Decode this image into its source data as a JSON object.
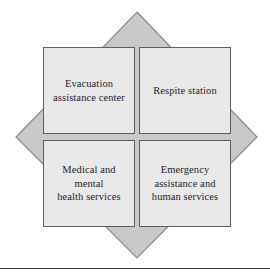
{
  "figure": {
    "name": "emergency-services-quadrant-diagram",
    "background_color": "#ffffff",
    "diamond": {
      "icon": "diamond-shape",
      "fill_color": "#c9c9c9",
      "stroke_color": "#8a8a8a",
      "points": "137,12 257,137 137,258 16,137"
    },
    "box_fill_color": "#e9e9e9",
    "box_border_color": "#5d5d5d",
    "text_color": "#1c1c2b",
    "quadrants": [
      {
        "id": "top-left",
        "label": "Evacuation\nassistance center"
      },
      {
        "id": "top-right",
        "label": "Respite station"
      },
      {
        "id": "bottom-left",
        "label": "Medical and mental\nhealth services"
      },
      {
        "id": "bottom-right",
        "label": "Emergency\nassistance and\nhuman services"
      }
    ]
  },
  "footer": {
    "rule_color": "#3a3a3a"
  }
}
